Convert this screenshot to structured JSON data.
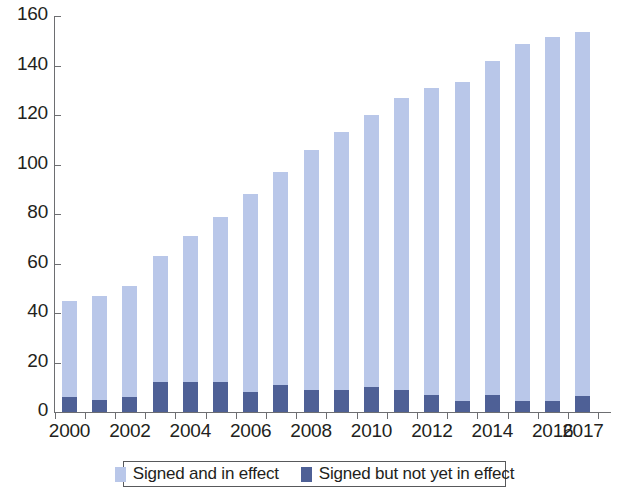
{
  "chart_data": {
    "type": "bar",
    "stacked": true,
    "title": "",
    "xlabel": "",
    "ylabel": "",
    "ylim": [
      0,
      160
    ],
    "ytick_values": [
      0,
      20,
      40,
      60,
      80,
      100,
      120,
      140,
      160
    ],
    "ytick_labels": [
      "0",
      "20",
      "40",
      "60",
      "80",
      "100",
      "120",
      "140",
      "160"
    ],
    "grid": false,
    "legend_position": "bottom",
    "categories": [
      "2000",
      "2001",
      "2002",
      "2003",
      "2004",
      "2005",
      "2006",
      "2007",
      "2008",
      "2009",
      "2010",
      "2011",
      "2012",
      "2013",
      "2014",
      "2015",
      "2016",
      "2017"
    ],
    "xtick_labels": [
      "2000",
      "2002",
      "2004",
      "2006",
      "2008",
      "2010",
      "2012",
      "2014",
      "2016",
      "2017"
    ],
    "series": [
      {
        "name": "Signed and in effect",
        "color": "#b9c7e9",
        "values": [
          39,
          42,
          45,
          51,
          59,
          67,
          80,
          86,
          97,
          104,
          110,
          118,
          124,
          129,
          135,
          144,
          147,
          147
        ]
      },
      {
        "name": "Signed but not yet in effect",
        "color": "#4e6096",
        "values": [
          6,
          5,
          6,
          12,
          12,
          12,
          8,
          11,
          9,
          9,
          10,
          9,
          7,
          4.5,
          7,
          4.5,
          4.5,
          6.5
        ]
      }
    ],
    "totals": [
      45,
      47,
      51,
      63,
      71,
      79,
      88,
      97,
      106,
      113,
      120,
      127,
      131,
      133.5,
      142,
      148.5,
      151.5,
      153.5
    ]
  },
  "legend": {
    "items": [
      {
        "label": "Signed and in effect",
        "swatch": "light-blue-swatch"
      },
      {
        "label": "Signed but not yet in effect",
        "swatch": "dark-blue-swatch"
      }
    ]
  }
}
